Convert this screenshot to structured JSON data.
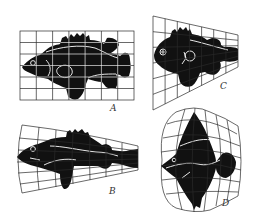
{
  "figure": {
    "panels": [
      {
        "id": "A",
        "label": "A",
        "grid": "rectangular, 7 columns x 6 rows",
        "fish": "reference fish (Polyprion-like)"
      },
      {
        "id": "B",
        "label": "B",
        "grid": "fan-shaped, converging toward tail",
        "fish": "elongated perch-like fish (Scorpaena-like)"
      },
      {
        "id": "C",
        "label": "C",
        "grid": "trapezoidal, converging toward tail",
        "fish": "deep-headed fish (Antigonia-like)"
      },
      {
        "id": "D",
        "label": "D",
        "grid": "barrel-shaped, bulging vertically",
        "fish": "deep-bodied diamond fish"
      }
    ],
    "colors": {
      "ink": "#111111",
      "grid_line": "#333333",
      "grid_on_fish": "#ffffff",
      "background": "#ffffff"
    }
  }
}
